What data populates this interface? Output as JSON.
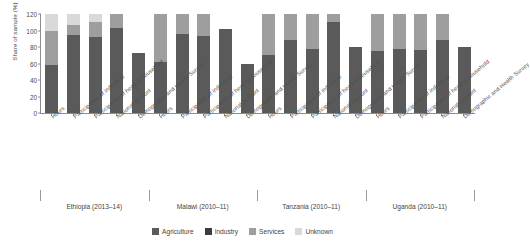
{
  "chart_data": {
    "type": "bar",
    "subtype": "stacked-bar-grouped",
    "title": "",
    "xlabel": "",
    "ylabel": "Share of sample (%)",
    "ylim": [
      0,
      120
    ],
    "yticks": [
      0,
      20,
      40,
      60,
      80,
      100,
      120
    ],
    "grid": false,
    "legend_position": "bottom",
    "legend": [
      "Agriculture",
      "Industry",
      "Services",
      "Unknown"
    ],
    "colors": {
      "Agriculture": "#5a5a5a",
      "Industry": "#3c3c3c",
      "Services": "#9e9e9e",
      "Unknown": "#d9d9d9"
    },
    "categories": [
      "Hours",
      "Participation of individual",
      "Participation of head of household",
      "National account",
      "Demographic and Health Survey"
    ],
    "groups": [
      {
        "name": "Ethiopia (2013–14)",
        "bars": [
          {
            "category": "Hours",
            "Agriculture": 58,
            "Industry": 0,
            "Services": 41,
            "Unknown": 21,
            "total": 120
          },
          {
            "category": "Participation of individual",
            "Agriculture": 95,
            "Industry": 0,
            "Services": 12,
            "Unknown": 13,
            "total": 120
          },
          {
            "category": "Participation of head of household",
            "Agriculture": 92,
            "Industry": 0,
            "Services": 18,
            "Unknown": 10,
            "total": 120
          },
          {
            "category": "National account",
            "Agriculture": 103,
            "Industry": 0,
            "Services": 17,
            "Unknown": 0,
            "total": 120
          },
          {
            "category": "Demographic and Health Survey",
            "Agriculture": 73,
            "Industry": 0,
            "Services": 0,
            "Unknown": 0,
            "total": 73
          }
        ]
      },
      {
        "name": "Malawi (2010–11)",
        "bars": [
          {
            "category": "Hours",
            "Agriculture": 62,
            "Industry": 0,
            "Services": 58,
            "Unknown": 0,
            "total": 120
          },
          {
            "category": "Participation of individual",
            "Agriculture": 96,
            "Industry": 0,
            "Services": 24,
            "Unknown": 0,
            "total": 120
          },
          {
            "category": "Participation of head of household",
            "Agriculture": 93,
            "Industry": 0,
            "Services": 27,
            "Unknown": 0,
            "total": 120
          },
          {
            "category": "National account",
            "Agriculture": 102,
            "Industry": 0,
            "Services": 0,
            "Unknown": 0,
            "total": 102
          },
          {
            "category": "Demographic and Health Survey",
            "Agriculture": 60,
            "Industry": 0,
            "Services": 0,
            "Unknown": 0,
            "total": 60
          }
        ]
      },
      {
        "name": "Tanzania (2010–11)",
        "bars": [
          {
            "category": "Hours",
            "Agriculture": 70,
            "Industry": 0,
            "Services": 50,
            "Unknown": 0,
            "total": 120
          },
          {
            "category": "Participation of individual",
            "Agriculture": 89,
            "Industry": 0,
            "Services": 31,
            "Unknown": 0,
            "total": 120
          },
          {
            "category": "Participation of head of household",
            "Agriculture": 77,
            "Industry": 0,
            "Services": 43,
            "Unknown": 0,
            "total": 120
          },
          {
            "category": "National account",
            "Agriculture": 110,
            "Industry": 0,
            "Services": 10,
            "Unknown": 0,
            "total": 120
          },
          {
            "category": "Demographic and Health Survey",
            "Agriculture": 80,
            "Industry": 0,
            "Services": 0,
            "Unknown": 0,
            "total": 80
          }
        ]
      },
      {
        "name": "Uganda (2010–11)",
        "bars": [
          {
            "category": "Hours",
            "Agriculture": 75,
            "Industry": 0,
            "Services": 45,
            "Unknown": 0,
            "total": 120
          },
          {
            "category": "Participation of individual",
            "Agriculture": 77,
            "Industry": 0,
            "Services": 43,
            "Unknown": 0,
            "total": 120
          },
          {
            "category": "Participation of head of household",
            "Agriculture": 76,
            "Industry": 0,
            "Services": 44,
            "Unknown": 0,
            "total": 120
          },
          {
            "category": "National account",
            "Agriculture": 88,
            "Industry": 0,
            "Services": 32,
            "Unknown": 0,
            "total": 120
          },
          {
            "category": "Demographic and Health Survey",
            "Agriculture": 80,
            "Industry": 0,
            "Services": 0,
            "Unknown": 0,
            "total": 80
          }
        ]
      }
    ]
  }
}
